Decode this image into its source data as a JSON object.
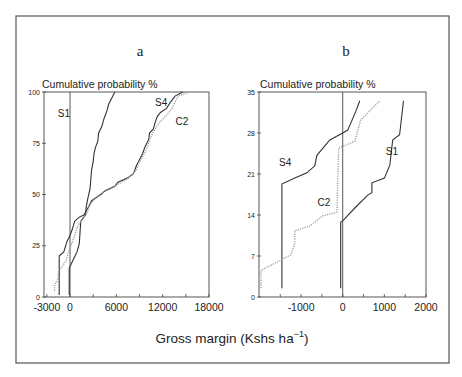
{
  "figure": {
    "xlabel": "Gross margin (Kshs ha",
    "xlabel_sup": "−1",
    "xlabel_close": ")"
  },
  "chart_data": [
    {
      "id": "a",
      "type": "line",
      "title": "a",
      "ylabel": "Cumulative probability  %",
      "xlabel": "Gross margin (Kshs ha-1)",
      "xlim": [
        -3370,
        18000
      ],
      "ylim": [
        0,
        100
      ],
      "xticks": [
        -3000,
        0,
        6000,
        12000,
        18000
      ],
      "xtick_labels": [
        "-3000",
        "0",
        "6000",
        "12000",
        "18000"
      ],
      "minor_xticks": [
        3000,
        9000,
        15000
      ],
      "yticks": [
        0,
        25,
        50,
        75,
        100
      ],
      "ytick_labels": [
        "0",
        "25",
        "50",
        "75",
        "100"
      ],
      "zero_line_x": 0,
      "grid": false,
      "series": [
        {
          "name": "S1",
          "style": "solid",
          "color": "#333333",
          "label_pos": [
            -800,
            88
          ],
          "points": [
            [
              -100,
              1
            ],
            [
              -100,
              14
            ],
            [
              400,
              18
            ],
            [
              900,
              22
            ],
            [
              1200,
              26
            ],
            [
              1300,
              32
            ],
            [
              1400,
              37
            ],
            [
              2000,
              40
            ],
            [
              2100,
              44
            ],
            [
              2300,
              48
            ],
            [
              2600,
              53
            ],
            [
              2700,
              58
            ],
            [
              2800,
              62
            ],
            [
              3000,
              66
            ],
            [
              3100,
              70
            ],
            [
              3300,
              73
            ],
            [
              3600,
              76
            ],
            [
              3700,
              80
            ],
            [
              4100,
              83
            ],
            [
              4400,
              87
            ],
            [
              4800,
              91
            ],
            [
              5000,
              94
            ],
            [
              5400,
              97
            ],
            [
              5800,
              100
            ]
          ]
        },
        {
          "name": "S4",
          "style": "solid",
          "color": "#333333",
          "label_pos": [
            11800,
            93
          ],
          "points": [
            [
              -1400,
              1
            ],
            [
              -1400,
              20
            ],
            [
              -800,
              22
            ],
            [
              -400,
              27
            ],
            [
              0,
              30
            ],
            [
              300,
              33
            ],
            [
              600,
              37
            ],
            [
              1200,
              39
            ],
            [
              1800,
              40
            ],
            [
              2400,
              44
            ],
            [
              2800,
              47
            ],
            [
              4000,
              50
            ],
            [
              4600,
              52
            ],
            [
              5800,
              54
            ],
            [
              6200,
              56
            ],
            [
              7400,
              58
            ],
            [
              8200,
              60
            ],
            [
              8600,
              64
            ],
            [
              9000,
              67
            ],
            [
              9400,
              70
            ],
            [
              9700,
              73
            ],
            [
              10200,
              77
            ],
            [
              10300,
              80
            ],
            [
              10800,
              82
            ],
            [
              11000,
              85
            ],
            [
              11300,
              88
            ],
            [
              11700,
              90
            ],
            [
              12500,
              92
            ],
            [
              13000,
              95
            ],
            [
              13600,
              98
            ],
            [
              14600,
              100
            ]
          ]
        },
        {
          "name": "C2",
          "style": "dotted",
          "color": "#9a9a9a",
          "label_pos": [
            14500,
            84
          ],
          "points": [
            [
              -2000,
              3
            ],
            [
              -2000,
              6
            ],
            [
              -1600,
              8
            ],
            [
              -1500,
              12
            ],
            [
              -1000,
              15
            ],
            [
              -500,
              18
            ],
            [
              -200,
              22
            ],
            [
              200,
              26
            ],
            [
              600,
              30
            ],
            [
              900,
              34
            ],
            [
              1600,
              38
            ],
            [
              2200,
              41
            ],
            [
              2600,
              45
            ],
            [
              3200,
              48
            ],
            [
              4200,
              51
            ],
            [
              5400,
              53
            ],
            [
              6200,
              55
            ],
            [
              7600,
              58
            ],
            [
              8600,
              62
            ],
            [
              9000,
              66
            ],
            [
              9500,
              69
            ],
            [
              9900,
              72
            ],
            [
              10300,
              76
            ],
            [
              10700,
              80
            ],
            [
              11200,
              83
            ],
            [
              11800,
              86
            ],
            [
              12600,
              89
            ],
            [
              13200,
              92
            ],
            [
              13600,
              95
            ],
            [
              14000,
              98
            ],
            [
              15500,
              100
            ]
          ]
        }
      ]
    },
    {
      "id": "b",
      "type": "line",
      "title": "b",
      "ylabel": "Cumulative probability  %",
      "xlabel": "Gross margin (Kshs ha-1)",
      "xlim": [
        -2010,
        2000
      ],
      "ylim": [
        0,
        35
      ],
      "xticks": [
        -1000,
        0,
        1000,
        2000
      ],
      "xtick_labels": [
        "-1000",
        "0",
        "1000",
        "2000"
      ],
      "minor_xticks": [
        -1500,
        -500,
        500,
        1500
      ],
      "yticks": [
        0,
        7,
        14,
        21,
        28,
        35
      ],
      "ytick_labels": [
        "0",
        "7",
        "14",
        "21",
        "28",
        "35"
      ],
      "zero_line_x": 0,
      "grid": false,
      "series": [
        {
          "name": "S4",
          "style": "solid",
          "color": "#333333",
          "label_pos": [
            -1380,
            22.4
          ],
          "points": [
            [
              -1460,
              1.5
            ],
            [
              -1460,
              19.3
            ],
            [
              -1150,
              20.3
            ],
            [
              -860,
              21.2
            ],
            [
              -670,
              22.4
            ],
            [
              -620,
              24.2
            ],
            [
              -310,
              26.8
            ],
            [
              0,
              28
            ],
            [
              120,
              28.5
            ],
            [
              310,
              31.6
            ],
            [
              410,
              33.5
            ]
          ]
        },
        {
          "name": "C2",
          "style": "dotted",
          "color": "#9a9a9a",
          "label_pos": [
            -450,
            15.6
          ],
          "points": [
            [
              -1960,
              1.5
            ],
            [
              -1960,
              4.6
            ],
            [
              -1560,
              6
            ],
            [
              -1250,
              7.2
            ],
            [
              -1150,
              9.2
            ],
            [
              -1150,
              11.3
            ],
            [
              -790,
              12.1
            ],
            [
              -500,
              13.8
            ],
            [
              -140,
              14.5
            ],
            [
              -96,
              25.4
            ],
            [
              290,
              26.6
            ],
            [
              430,
              30.2
            ],
            [
              890,
              33.5
            ]
          ]
        },
        {
          "name": "S1",
          "style": "solid",
          "color": "#333333",
          "label_pos": [
            1180,
            24.2
          ],
          "points": [
            [
              -48,
              1.5
            ],
            [
              -48,
              12.8
            ],
            [
              0,
              13
            ],
            [
              290,
              15.2
            ],
            [
              600,
              17.4
            ],
            [
              700,
              17.8
            ],
            [
              700,
              19.5
            ],
            [
              1000,
              20.3
            ],
            [
              1130,
              22.5
            ],
            [
              1200,
              26.8
            ],
            [
              1365,
              27.7
            ],
            [
              1460,
              33.5
            ]
          ]
        }
      ]
    }
  ]
}
